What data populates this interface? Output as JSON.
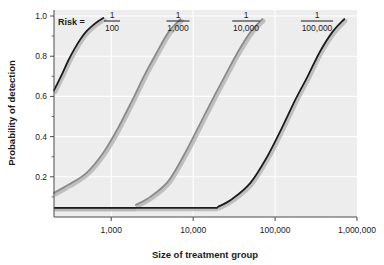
{
  "chart_data": {
    "type": "line",
    "title": "",
    "xlabel": "Size of treatment group",
    "ylabel": "Probability of detection",
    "xscale": "log",
    "xlim": [
      200,
      1000000
    ],
    "ylim": [
      0.0,
      1.03
    ],
    "grid": true,
    "legend_position": "top-inside",
    "xticks": [
      1000,
      10000,
      100000,
      1000000
    ],
    "xtick_labels": [
      "1,000",
      "10,000",
      "100,000",
      "1,000,000"
    ],
    "yticks": [
      0.2,
      0.4,
      0.6,
      0.8,
      1.0
    ],
    "ytick_labels": [
      "0.2",
      "0.4",
      "0.6",
      "0.8",
      "1.0"
    ],
    "y_minor_ticks": [
      0.1,
      0.3,
      0.5,
      0.7,
      0.9
    ],
    "annotations": [
      {
        "text": "Risk =",
        "x_px": 56,
        "y_px": 22
      }
    ],
    "series": [
      {
        "name": "1/100",
        "risk_numerator": "1",
        "risk_denominator": "100",
        "color": "#1c1c1c",
        "x": [
          200,
          250,
          300,
          360,
          420,
          500,
          600,
          700,
          800
        ],
        "values": [
          0.63,
          0.71,
          0.78,
          0.84,
          0.885,
          0.925,
          0.955,
          0.975,
          0.99
        ]
      },
      {
        "name": "1/1,000",
        "risk_numerator": "1",
        "risk_denominator": "1,000",
        "color": "#8a8a8a",
        "x": [
          200,
          300,
          500,
          800,
          1200,
          1800,
          2500,
          3500,
          5000,
          7000
        ],
        "values": [
          0.12,
          0.16,
          0.22,
          0.32,
          0.44,
          0.58,
          0.7,
          0.81,
          0.92,
          0.985
        ]
      },
      {
        "name": "1/10,000",
        "risk_numerator": "1",
        "risk_denominator": "10,000",
        "color": "#8a8a8a",
        "x": [
          2000,
          3000,
          5000,
          8000,
          12000,
          18000,
          25000,
          35000,
          50000,
          70000
        ],
        "values": [
          0.06,
          0.1,
          0.18,
          0.32,
          0.46,
          0.6,
          0.71,
          0.82,
          0.92,
          0.985
        ]
      },
      {
        "name": "1/100,000",
        "risk_numerator": "1",
        "risk_denominator": "100,000",
        "color": "#1c1c1c",
        "x": [
          20000,
          30000,
          50000,
          80000,
          120000,
          180000,
          250000,
          350000,
          500000,
          700000
        ],
        "values": [
          0.05,
          0.09,
          0.17,
          0.3,
          0.44,
          0.59,
          0.7,
          0.82,
          0.92,
          0.985
        ]
      }
    ]
  },
  "labels": {
    "risk_prefix": "Risk =",
    "y_axis_title": "Probability of detection",
    "x_axis_title": "Size of treatment group"
  },
  "colors": {
    "panel_background": "#ededed",
    "gridline": "#ffffff",
    "axis": "#4a4a4a",
    "curve_dark": "#1c1c1c",
    "curve_gray": "#8a8a8a",
    "curve_shadow": "#b6b6b6",
    "text": "#1a1a1a"
  }
}
